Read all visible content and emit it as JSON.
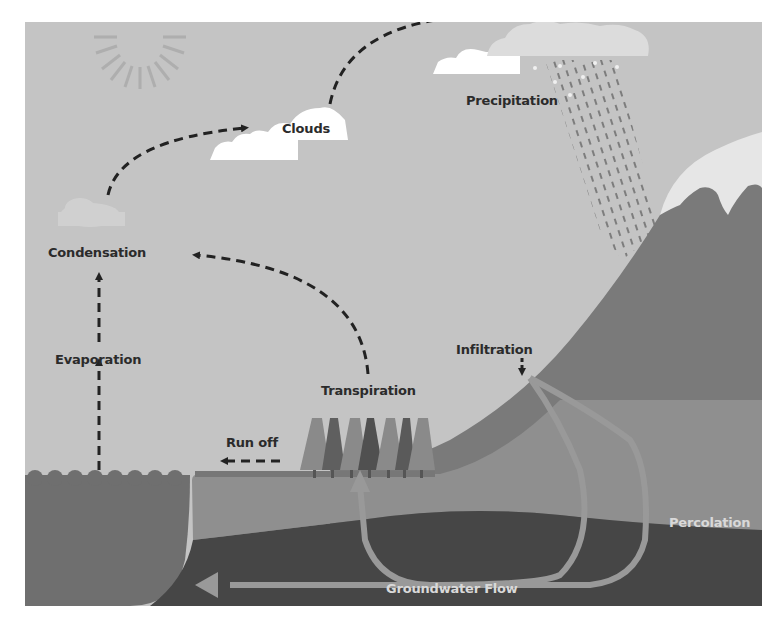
{
  "colors": {
    "sky": "#c4c4c4",
    "sun": "#a9a9a9",
    "cloud": "#ffffff",
    "cloud_faded": "#dcdcdc",
    "rain": "#7d7d7d",
    "mountain": "#7a7a7a",
    "snow": "#e6e6e6",
    "water": "#6f6f6f",
    "topsoil": "#8f8f8f",
    "bedrock": "#464646",
    "flow_line": "#999999",
    "arrow": "#222222",
    "tree_light": "#8a8a8a",
    "tree_dark": "#5a5a5a",
    "label_dark": "#2b2b2b",
    "label_light": "#d9d9d9"
  },
  "labels": {
    "clouds": "Clouds",
    "precipitation": "Precipitation",
    "condensation": "Condensation",
    "evaporation": "Evaporation",
    "transpiration": "Transpiration",
    "infiltration": "Infiltration",
    "run_off": "Run off",
    "percolation": "Percolation",
    "groundwater_flow": "Groundwater Flow"
  },
  "icons": {
    "sun": "sun-icon",
    "cloud": "cloud-icon",
    "rain": "rain-icon",
    "tree": "tree-icon",
    "mountain": "mountain-icon"
  }
}
